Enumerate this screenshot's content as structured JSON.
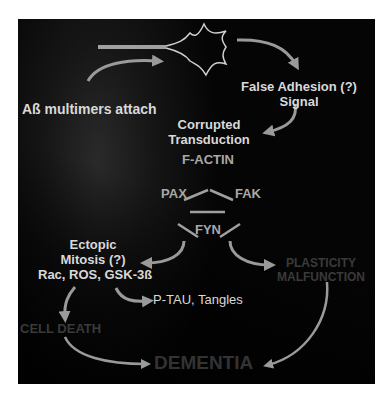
{
  "diagram": {
    "nodes": {
      "neuron": {
        "icon": "neuron-icon"
      },
      "abeta": {
        "label": "Aß multimers attach"
      },
      "false_adhesion": {
        "line1": "False Adhesion (?)",
        "line2": "Signal"
      },
      "corrupted": {
        "line1": "Corrupted",
        "line2": "Transduction"
      },
      "factin": {
        "label": "F-ACTIN"
      },
      "pax": {
        "label": "PAX"
      },
      "fak": {
        "label": "FAK"
      },
      "fyn": {
        "label": "FYN"
      },
      "ectopic": {
        "line1": "Ectopic",
        "line2": "Mitosis (?)",
        "line3": "Rac, ROS, GSK-3ß"
      },
      "plasticity": {
        "line1": "PLASTICITY",
        "line2": "MALFUNCTION"
      },
      "ptau": {
        "label": "P-TAU, Tangles"
      },
      "celldeath": {
        "label": "CELL DEATH"
      },
      "dementia": {
        "label": "DEMENTIA"
      }
    },
    "edges": [
      {
        "from": "abeta",
        "to": "neuron"
      },
      {
        "from": "neuron",
        "to": "false_adhesion"
      },
      {
        "from": "false_adhesion",
        "to": "corrupted"
      },
      {
        "from": "factin",
        "to": "pax"
      },
      {
        "from": "factin",
        "to": "fak"
      },
      {
        "from": "pax",
        "to": "fak"
      },
      {
        "from": "pax",
        "to": "fyn"
      },
      {
        "from": "fak",
        "to": "fyn"
      },
      {
        "from": "fyn",
        "to": "ectopic"
      },
      {
        "from": "fyn",
        "to": "plasticity"
      },
      {
        "from": "ectopic",
        "to": "ptau"
      },
      {
        "from": "ectopic",
        "to": "celldeath"
      },
      {
        "from": "celldeath",
        "to": "dementia"
      },
      {
        "from": "plasticity",
        "to": "dementia"
      }
    ],
    "colors": {
      "background": "#050505",
      "text_primary": "#d9d9d9",
      "text_secondary": "#a8a8a8",
      "text_faded": "#3a3a3a",
      "arrow": "#9a9a9a"
    }
  }
}
